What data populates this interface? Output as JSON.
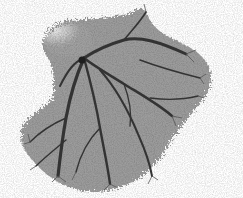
{
  "image": {
    "subject": "Grayscale branching vascular cast on white background",
    "alt": "Branching tree-like vessel cast specimen",
    "colors": {
      "background": "#ffffff",
      "mass_light": "#b8b8b8",
      "mass_mid": "#8a8a8a",
      "branch_dark": "#2e2e2e",
      "highlight": "#e6e6e6"
    }
  }
}
